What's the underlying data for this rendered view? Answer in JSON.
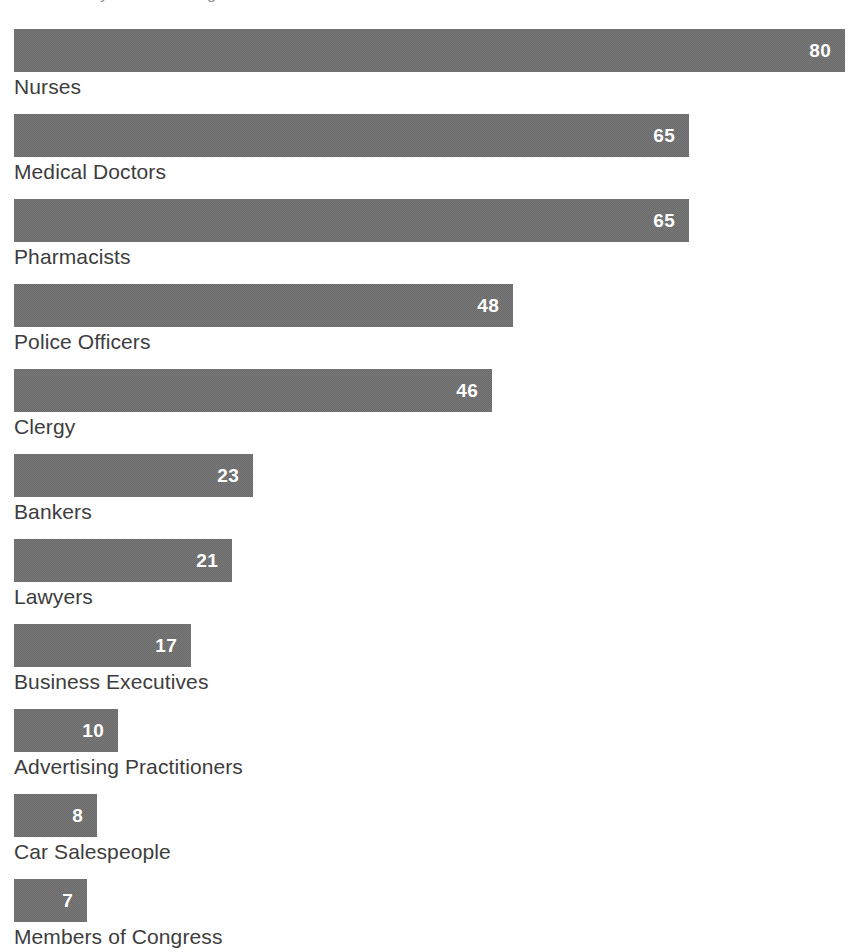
{
  "header": {
    "legend_marker": "legend-line-swatch",
    "title_partial": "Honesty/Ethics Ratings"
  },
  "chart_data": {
    "type": "bar",
    "orientation": "horizontal",
    "title": "Honesty/Ethics Ratings",
    "xlabel": "",
    "ylabel": "",
    "xlim": [
      0,
      80
    ],
    "grid": false,
    "legend": "none",
    "value_label_position": "inside-end",
    "bar_color": "#6a6a6a",
    "value_label_color": "#ffffff",
    "category_label_color": "#3d3d3d",
    "categories": [
      "Nurses",
      "Medical Doctors",
      "Pharmacists",
      "Police Officers",
      "Clergy",
      "Bankers",
      "Lawyers",
      "Business Executives",
      "Advertising Practitioners",
      "Car Salespeople",
      "Members of Congress"
    ],
    "values": [
      80,
      65,
      65,
      48,
      46,
      23,
      21,
      17,
      10,
      8,
      7
    ],
    "bars": [
      {
        "label": "Nurses",
        "value": 80,
        "value_text": "80"
      },
      {
        "label": "Medical Doctors",
        "value": 65,
        "value_text": "65"
      },
      {
        "label": "Pharmacists",
        "value": 65,
        "value_text": "65"
      },
      {
        "label": "Police Officers",
        "value": 48,
        "value_text": "48"
      },
      {
        "label": "Clergy",
        "value": 46,
        "value_text": "46"
      },
      {
        "label": "Bankers",
        "value": 23,
        "value_text": "23"
      },
      {
        "label": "Lawyers",
        "value": 21,
        "value_text": "21"
      },
      {
        "label": "Business Executives",
        "value": 17,
        "value_text": "17"
      },
      {
        "label": "Advertising Practitioners",
        "value": 10,
        "value_text": "10"
      },
      {
        "label": "Car Salespeople",
        "value": 8,
        "value_text": "8"
      },
      {
        "label": "Members of Congress",
        "value": 7,
        "value_text": "7"
      }
    ]
  }
}
